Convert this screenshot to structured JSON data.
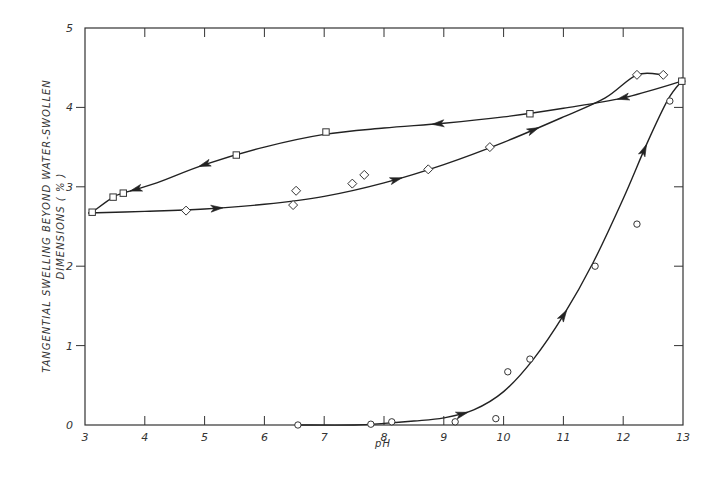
{
  "chart_data": {
    "type": "scatter",
    "title": "",
    "xlabel": "pH",
    "ylabel_line1": "TANGENTIAL  SWELLING  BEYOND  WATER-SWOLLEN",
    "ylabel_line2": "DIMENSIONS ( % )",
    "xlim": [
      3,
      13
    ],
    "ylim": [
      0,
      5
    ],
    "xticks": [
      3,
      4,
      5,
      6,
      7,
      8,
      9,
      10,
      11,
      12,
      13
    ],
    "yticks": [
      0,
      1,
      2,
      3,
      4,
      5
    ],
    "xtick_labels": [
      "3",
      "4",
      "5",
      "6",
      "7",
      "8",
      "9",
      "10",
      "11",
      "12",
      "13"
    ],
    "ytick_labels": [
      "0",
      "1",
      "2",
      "3",
      "4",
      "5"
    ],
    "grid": false,
    "legend": "none",
    "series": [
      {
        "name": "circles",
        "marker": "circle",
        "points": [
          [
            6.56,
            0.0
          ],
          [
            7.78,
            0.01
          ],
          [
            8.13,
            0.04
          ],
          [
            9.19,
            0.04
          ],
          [
            9.87,
            0.08
          ],
          [
            10.07,
            0.67
          ],
          [
            10.44,
            0.83
          ],
          [
            11.53,
            2.0
          ],
          [
            12.23,
            2.53
          ],
          [
            12.78,
            4.08
          ],
          [
            12.98,
            4.33
          ]
        ],
        "curve": [
          [
            6.56,
            0.0
          ],
          [
            7.5,
            0.0
          ],
          [
            8.0,
            0.02
          ],
          [
            8.5,
            0.05
          ],
          [
            9.0,
            0.09
          ],
          [
            9.5,
            0.19
          ],
          [
            10.0,
            0.42
          ],
          [
            10.5,
            0.83
          ],
          [
            11.0,
            1.38
          ],
          [
            11.5,
            2.05
          ],
          [
            12.0,
            2.85
          ],
          [
            12.4,
            3.55
          ],
          [
            12.75,
            4.1
          ],
          [
            13.0,
            4.35
          ]
        ],
        "arrows_at_x": [
          9.3,
          11.0,
          12.35
        ]
      },
      {
        "name": "diamonds",
        "marker": "diamond",
        "points": [
          [
            4.69,
            2.7
          ],
          [
            6.48,
            2.77
          ],
          [
            6.53,
            2.95
          ],
          [
            7.47,
            3.04
          ],
          [
            7.67,
            3.15
          ],
          [
            8.74,
            3.22
          ],
          [
            9.77,
            3.5
          ],
          [
            12.23,
            4.41
          ],
          [
            12.67,
            4.41
          ]
        ],
        "curve": [
          [
            3.05,
            2.67
          ],
          [
            4.0,
            2.69
          ],
          [
            5.0,
            2.72
          ],
          [
            6.0,
            2.78
          ],
          [
            7.0,
            2.88
          ],
          [
            8.0,
            3.05
          ],
          [
            9.0,
            3.28
          ],
          [
            10.0,
            3.56
          ],
          [
            11.0,
            3.88
          ],
          [
            11.7,
            4.12
          ],
          [
            12.23,
            4.41
          ],
          [
            12.67,
            4.41
          ]
        ],
        "arrows_at_x": [
          5.2,
          8.2,
          10.5
        ]
      },
      {
        "name": "squares",
        "marker": "square",
        "points": [
          [
            3.12,
            2.68
          ],
          [
            3.47,
            2.87
          ],
          [
            3.64,
            2.92
          ],
          [
            5.53,
            3.4
          ],
          [
            7.03,
            3.69
          ],
          [
            10.44,
            3.92
          ],
          [
            12.98,
            4.33
          ]
        ],
        "curve": [
          [
            12.98,
            4.33
          ],
          [
            12.0,
            4.12
          ],
          [
            11.0,
            3.99
          ],
          [
            10.0,
            3.88
          ],
          [
            9.0,
            3.8
          ],
          [
            8.0,
            3.74
          ],
          [
            7.0,
            3.66
          ],
          [
            6.0,
            3.5
          ],
          [
            5.0,
            3.28
          ],
          [
            4.2,
            3.05
          ],
          [
            3.64,
            2.92
          ],
          [
            3.47,
            2.87
          ],
          [
            3.12,
            2.68
          ]
        ],
        "arrows_at_x": [
          12.0,
          8.9,
          5.0,
          3.85
        ]
      }
    ]
  }
}
